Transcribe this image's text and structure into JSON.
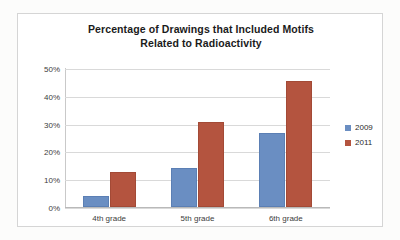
{
  "chart_data": {
    "type": "bar",
    "title": "Percentage of Drawings that Included Motifs Related to Radioactivity",
    "title_line1": "Percentage of Drawings that Included Motifs",
    "title_line2": "Related to Radioactivity",
    "xlabel": "",
    "ylabel": "",
    "categories": [
      "4th grade",
      "5th grade",
      "6th grade"
    ],
    "series": [
      {
        "name": "2009",
        "color": "#6a8ec2",
        "values": [
          4,
          14,
          26.5
        ]
      },
      {
        "name": "2011",
        "color": "#b4543f",
        "values": [
          12.5,
          30.5,
          45.5
        ]
      }
    ],
    "ylim": [
      0,
      50
    ],
    "ytick_values": [
      0,
      10,
      20,
      30,
      40,
      50
    ],
    "ytick_labels": [
      "0%",
      "10%",
      "20%",
      "30%",
      "40%",
      "50%"
    ],
    "grid": true,
    "legend_position": "right"
  }
}
